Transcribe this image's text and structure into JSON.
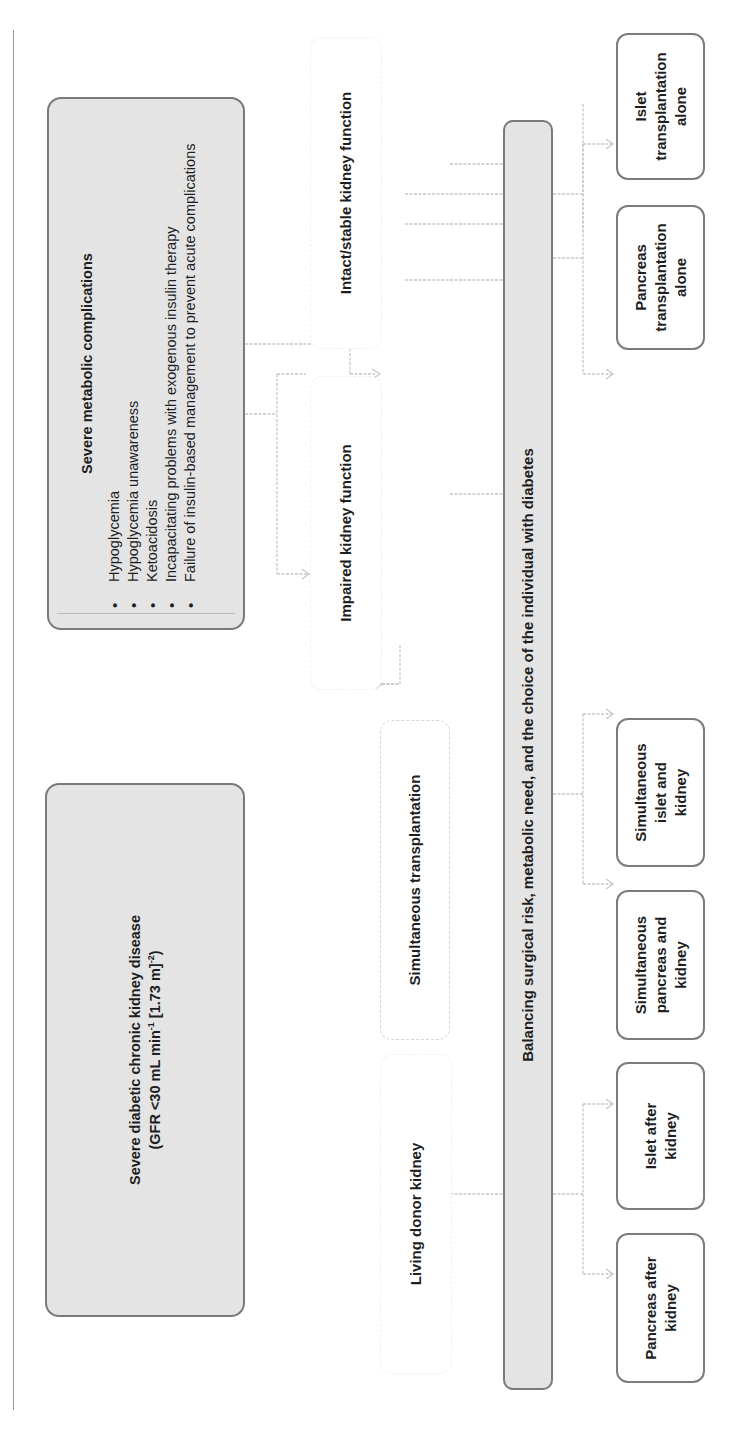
{
  "diagram": {
    "orientation": "rotated -90deg (reads bottom-to-top)",
    "root_nodes": {
      "ckd": {
        "title": "Severe diabetic chronic kidney disease",
        "subtitle_prefix": "(GFR <30 mL min",
        "sup1": "-1",
        "subtitle_mid": " [1.73 m]",
        "sup2": "-2",
        "subtitle_suffix": ")"
      },
      "metabolic": {
        "title": "Severe metabolic complications",
        "items": [
          "Hypoglycemia",
          "Hypoglycemia unawareness",
          "Ketoacidosis",
          "Incapacitating problems with exogenous insulin therapy",
          "Failure of insulin-based management to prevent acute complications"
        ]
      }
    },
    "intermediate_nodes": {
      "living_donor": "Living donor kidney",
      "simultaneous": "Simultaneous transplantation",
      "impaired": "Impaired kidney function",
      "intact": "Intact/stable kidney function"
    },
    "balance_bar": "Balancing surgical risk, metabolic need, and the choice of the individual with diabetes",
    "outcomes": [
      "Pancreas after kidney",
      "Islet after kidney",
      "Simultaneous pancreas and kidney",
      "Simultaneous islet and kidney",
      "Pancreas transplantation alone",
      "Islet transplantation alone"
    ],
    "colors": {
      "root_fill": "#e4e4e4",
      "root_border": "#7a7a7a",
      "connector": "#c8c8c8",
      "outcome_border": "#7c7c7c"
    }
  }
}
